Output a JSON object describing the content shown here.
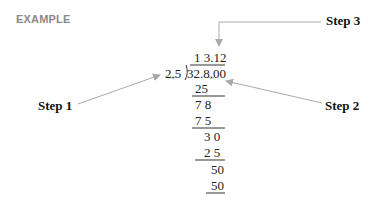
{
  "title": "EXAMPLE",
  "steps": [
    {
      "label": "Step 1",
      "target": "decimal point of divisor 2.5"
    },
    {
      "label": "Step 2",
      "target": "shifted decimal point of dividend"
    },
    {
      "label": "Step 3",
      "target": "decimal point in quotient"
    }
  ],
  "division": {
    "quotient": "1 3.12",
    "divisor": "2.5",
    "dividend": "32.8.00",
    "work": [
      "25",
      "7 8",
      "7 5",
      "3 0",
      "2 5",
      "50",
      "50"
    ]
  },
  "colors": {
    "arrow": "#aaaaaa",
    "rule": "#333333",
    "example_label": "#8a8a8a"
  }
}
